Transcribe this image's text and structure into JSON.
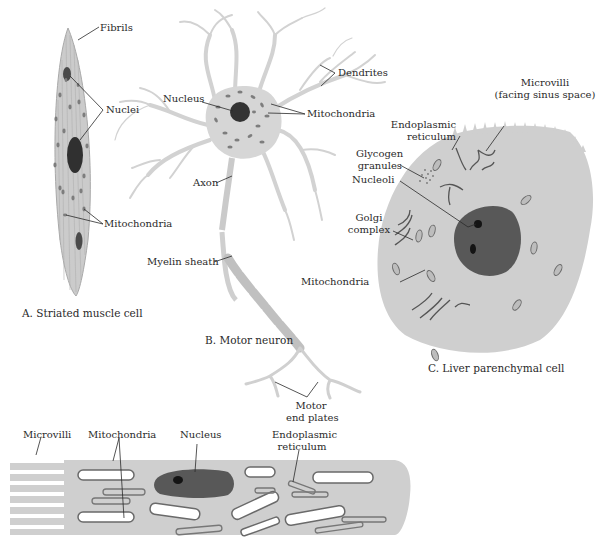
{
  "figure": {
    "colors": {
      "cytoplasm": "#cfcfcf",
      "cytoplasm_outline": "#b8b8b8",
      "nucleus": "#585858",
      "nucleolus": "#141414",
      "organelle": "#7a7a7a",
      "neuron": "#d6d6d6",
      "leader_line": "#2a2a2a"
    }
  },
  "panels": {
    "muscle": {
      "caption": "A.  Striated muscle cell",
      "labels": {
        "fibrils": "Fibrils",
        "nuclei": "Nuclei",
        "mitochondria": "Mitochondria"
      }
    },
    "neuron": {
      "caption": "B.  Motor neuron",
      "labels": {
        "dendrites": "Dendrites",
        "nucleus": "Nucleus",
        "mitochondria": "Mitochondria",
        "axon": "Axon",
        "myelin_sheath": "Myelin sheath",
        "motor_end_plates_1": "Motor",
        "motor_end_plates_2": "end plates"
      }
    },
    "liver": {
      "caption": "C.  Liver parenchymal cell",
      "labels": {
        "microvilli_1": "Microvilli",
        "microvilli_2": "(facing sinus space)",
        "er_1": "Endoplasmic",
        "er_2": "reticulum",
        "glycogen_1": "Glycogen",
        "glycogen_2": "granules",
        "nucleoli": "Nucleoli",
        "golgi_1": "Golgi",
        "golgi_2": "complex",
        "mitochondria": "Mitochondria"
      }
    },
    "intestinal": {
      "labels": {
        "microvilli": "Microvilli",
        "mitochondria": "Mitochondria",
        "nucleus": "Nucleus",
        "er_1": "Endoplasmic",
        "er_2": "reticulum"
      }
    }
  }
}
